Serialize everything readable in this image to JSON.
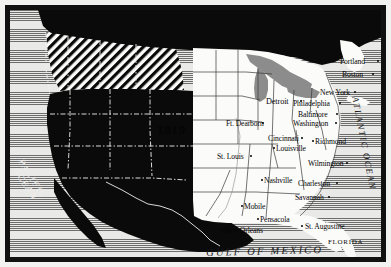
{
  "map": {
    "title_year": "1819",
    "colors": {
      "foreign_territory": "#0a0a0a",
      "united_states": "#fbfbfa",
      "great_lakes": "#8c8c8c",
      "ocean_hatch": "#6d6d6d",
      "frame": "#111111",
      "page": "#f2f2f0"
    },
    "oceans": [
      {
        "name": "PACIFIC OCEAN",
        "line1": "PACIFIC",
        "line2": "OCEAN"
      },
      {
        "name": "ATLANTIC OCEAN",
        "text": "ATLANTIC OCEAN"
      },
      {
        "name": "GULF OF MEXICO",
        "text": "GULF OF MEXICO"
      }
    ],
    "regions": [
      {
        "name": "FLORIDA",
        "label": "FLORIDA"
      }
    ],
    "cities": [
      {
        "name": "Portland",
        "label": "Portland"
      },
      {
        "name": "Boston",
        "label": "Boston"
      },
      {
        "name": "New York",
        "label": "New York"
      },
      {
        "name": "Philadelphia",
        "label": "Philadelphia"
      },
      {
        "name": "Baltimore",
        "label": "Baltimore"
      },
      {
        "name": "Washington",
        "label": "Washington"
      },
      {
        "name": "Richmond",
        "label": "Richmond"
      },
      {
        "name": "Wilmington",
        "label": "Wilmington"
      },
      {
        "name": "Charleston",
        "label": "Charleston"
      },
      {
        "name": "Savannah",
        "label": "Savannah"
      },
      {
        "name": "St. Augustine",
        "label": "St. Augustine"
      },
      {
        "name": "Pensacola",
        "label": "Pensacola"
      },
      {
        "name": "Mobile",
        "label": "Mobile"
      },
      {
        "name": "New Orleans",
        "label": "New Orleans"
      },
      {
        "name": "Nashville",
        "label": "Nashville"
      },
      {
        "name": "Louisville",
        "label": "Louisville"
      },
      {
        "name": "Cincinnati",
        "label": "Cincinnati"
      },
      {
        "name": "St. Louis",
        "label": "St. Louis"
      },
      {
        "name": "Ft. Dearborn",
        "label": "Ft. Dearborn"
      },
      {
        "name": "Detroit",
        "label": "Detroit"
      }
    ]
  }
}
